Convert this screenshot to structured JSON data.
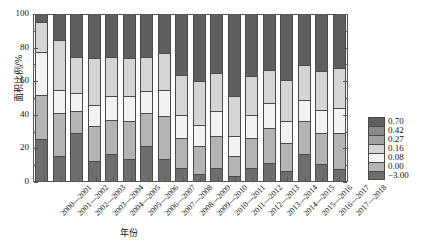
{
  "chart_data": {
    "type": "bar",
    "subtype": "stacked-100-percent",
    "title": "",
    "xlabel": "年份",
    "ylabel": "面积比例/%",
    "ylim": [
      0,
      100
    ],
    "yticks": [
      0,
      20,
      40,
      60,
      80,
      100
    ],
    "grid": false,
    "legend_position": "right",
    "categories": [
      "2000—2001",
      "2001—2002",
      "2002—2003",
      "2003—2004",
      "2004—2005",
      "2005—2006",
      "2006—2007",
      "2007—2008",
      "2008—2009",
      "2009—2010",
      "2010—2011",
      "2011—2012",
      "2012—2013",
      "2013—2014",
      "2014—2015",
      "2015—2016",
      "2016—2017",
      "2017—2018"
    ],
    "series": [
      {
        "name": "-3.00",
        "color": "#6e6e6e",
        "values": [
          25,
          15,
          29,
          12,
          16,
          13,
          21,
          13,
          8,
          4,
          8,
          3,
          8,
          11,
          6,
          16,
          10,
          7
        ]
      },
      {
        "name": "0.00",
        "color": "#b4b4b4",
        "values": [
          27,
          26,
          13,
          21,
          21,
          23,
          20,
          26,
          18,
          17,
          19,
          12,
          18,
          21,
          17,
          20,
          19,
          22
        ]
      },
      {
        "name": "0.08",
        "color": "#f2f2f2",
        "values": [
          26,
          14,
          11,
          13,
          14,
          15,
          13,
          16,
          14,
          13,
          15,
          12,
          14,
          15,
          13,
          13,
          14,
          15
        ]
      },
      {
        "name": "0.16",
        "color": "#d5d5d5",
        "values": [
          18,
          30,
          22,
          28,
          24,
          23,
          21,
          22,
          24,
          26,
          23,
          24,
          23,
          20,
          25,
          21,
          23,
          24
        ]
      },
      {
        "name": "0.27",
        "color": "#a0a0a0",
        "values": [
          0,
          0,
          0,
          0,
          0,
          0,
          0,
          0,
          0,
          0,
          0,
          0,
          0,
          0,
          0,
          0,
          0,
          0
        ]
      },
      {
        "name": "0.42",
        "color": "#8a8a8a",
        "values": [
          0,
          0,
          0,
          0,
          0,
          0,
          0,
          0,
          0,
          0,
          0,
          0,
          0,
          0,
          0,
          0,
          0,
          0
        ]
      },
      {
        "name": "0.70",
        "color": "#5f5f5f",
        "values": [
          4,
          15,
          25,
          26,
          25,
          26,
          25,
          23,
          36,
          40,
          35,
          49,
          37,
          33,
          39,
          30,
          34,
          32
        ]
      }
    ]
  },
  "legend": {
    "entries": [
      {
        "label": "0.70",
        "color": "#5f5f5f"
      },
      {
        "label": "0.42",
        "color": "#8a8a8a"
      },
      {
        "label": "0.27",
        "color": "#a0a0a0"
      },
      {
        "label": "0.16",
        "color": "#d5d5d5"
      },
      {
        "label": "0.08",
        "color": "#f2f2f2"
      },
      {
        "label": "0.00",
        "color": "#b4b4b4"
      },
      {
        "label": "−3.00",
        "color": "#6e6e6e"
      }
    ]
  },
  "axes": {
    "y_title": "面积比例/%",
    "x_title": "年份",
    "y_tick_labels": [
      "0",
      "20",
      "40",
      "60",
      "80",
      "100"
    ]
  }
}
